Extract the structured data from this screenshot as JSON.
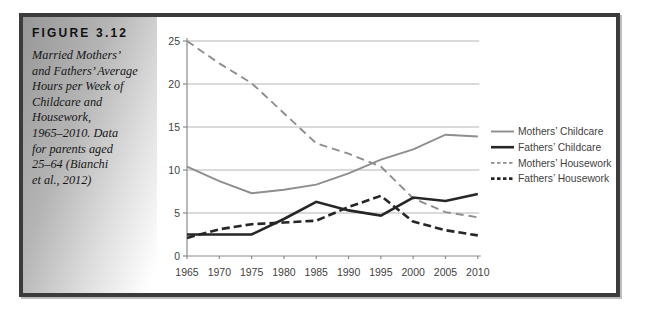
{
  "figure": {
    "label": "FIGURE 3.12",
    "caption_lines": [
      "Married Mothers’",
      "and Fathers’ Average",
      "Hours per Week of",
      "Childcare and",
      "Housework,",
      "1965–2010. Data",
      "for parents aged",
      "25–64 (Bianchi",
      "et al., 2012)"
    ]
  },
  "colors": {
    "frame_border": "#3b3b3b",
    "frame_shadow": "#bdbdbd",
    "grid": "#b5b5b5",
    "axis": "#8c8c8c",
    "tick_text": "#3f3f3f",
    "series_gray": "#8e8e8e",
    "series_black": "#262626"
  },
  "chart_data": {
    "type": "line",
    "x": [
      1965,
      1970,
      1975,
      1980,
      1985,
      1990,
      1995,
      2000,
      2005,
      2010
    ],
    "series": [
      {
        "name": "Mothers’ Childcare",
        "color": "#8e8e8e",
        "style": "solid",
        "width": 1.9,
        "values": [
          10.4,
          8.7,
          7.3,
          7.7,
          8.3,
          9.6,
          11.2,
          12.4,
          14.1,
          13.9
        ]
      },
      {
        "name": "Fathers’ Childcare",
        "color": "#262626",
        "style": "solid",
        "width": 2.6,
        "values": [
          2.5,
          2.5,
          2.5,
          4.3,
          6.3,
          5.3,
          4.7,
          6.8,
          6.4,
          7.2
        ]
      },
      {
        "name": "Mothers’ Housework",
        "color": "#8e8e8e",
        "style": "dashed",
        "width": 1.9,
        "values": [
          25.0,
          22.4,
          20.1,
          16.6,
          13.1,
          11.9,
          10.4,
          6.7,
          5.1,
          4.5
        ]
      },
      {
        "name": "Fathers’ Housework",
        "color": "#262626",
        "style": "dashed",
        "width": 2.6,
        "values": [
          2.1,
          3.1,
          3.7,
          3.9,
          4.1,
          5.7,
          7.0,
          4.0,
          3.0,
          2.4
        ]
      }
    ],
    "xticks": [
      "1965",
      "1970",
      "1975",
      "1980",
      "1985",
      "1990",
      "1995",
      "2000",
      "2005",
      "2010"
    ],
    "yticks": [
      "0",
      "5",
      "10",
      "15",
      "20",
      "25"
    ],
    "ylim": [
      0,
      25
    ],
    "ytick_step": 5,
    "grid": true,
    "legend_position": "right",
    "xlabel": "",
    "ylabel": "",
    "title": ""
  }
}
